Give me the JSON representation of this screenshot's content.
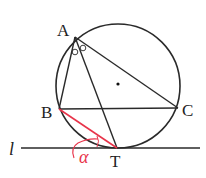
{
  "diagram": {
    "type": "geometry",
    "points": {
      "A": {
        "label": "A",
        "x": 75,
        "y": 37
      },
      "B": {
        "label": "B",
        "x": 59,
        "y": 109
      },
      "C": {
        "label": "C",
        "x": 178,
        "y": 108
      },
      "T": {
        "label": "T",
        "x": 117,
        "y": 148
      },
      "O": {
        "label": "",
        "x": 118,
        "y": 84
      }
    },
    "circle": {
      "cx": 118,
      "cy": 86,
      "r": 62
    },
    "tangent_line": {
      "label": "l",
      "x1": 21,
      "y1": 148,
      "x2": 200,
      "y2": 148
    },
    "segments": [
      {
        "from": "A",
        "to": "B"
      },
      {
        "from": "A",
        "to": "C"
      },
      {
        "from": "A",
        "to": "T"
      },
      {
        "from": "B",
        "to": "C"
      },
      {
        "from": "B",
        "to": "T",
        "highlight": true
      }
    ],
    "angle_marks": {
      "bisector_marks": "two small circles at A",
      "alpha_label": "α"
    },
    "colors": {
      "stroke": "#2a2a2a",
      "highlight": "#e8344a"
    }
  }
}
